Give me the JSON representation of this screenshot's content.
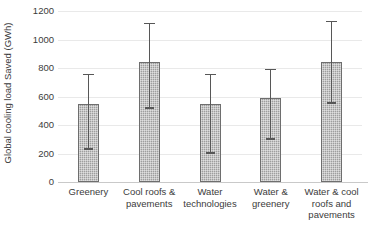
{
  "chart_data": {
    "type": "bar",
    "title": "",
    "xlabel": "",
    "ylabel": "Global cooling load Saved (GWh)",
    "categories": [
      "Greenery",
      "Cool roofs & pavements",
      "Water technologies",
      "Water & greenery",
      "Water & cool roofs and pavements"
    ],
    "values": [
      545,
      845,
      545,
      590,
      845
    ],
    "error_low": [
      225,
      515,
      195,
      295,
      545
    ],
    "error_high": [
      750,
      1110,
      750,
      785,
      1125
    ],
    "ylim": [
      0,
      1200
    ],
    "yticks": [
      0,
      200,
      400,
      600,
      800,
      1000,
      1200
    ],
    "ytick_labels": [
      "0",
      "200",
      "400",
      "600",
      "800",
      "1000",
      "1200"
    ],
    "grid": true,
    "legend": "none",
    "bar_color": "#9e9e9e",
    "bar_edge_color": "#6e6e6e",
    "error_color": "#575757",
    "grid_color": "#e9e9e9",
    "axis_color": "#c9c9c9",
    "text_color": "#3b3b3b"
  }
}
